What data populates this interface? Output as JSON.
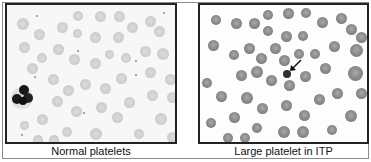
{
  "figure": {
    "panels": [
      {
        "id": "left",
        "caption": "Normal platelets",
        "description": "Blood smear with pale red cells, small scattered normal platelets and one neutrophil"
      },
      {
        "id": "right",
        "caption": "Large platelet in ITP",
        "description": "Blood smear with darker red cells and an arrow pointing to a large platelet"
      }
    ],
    "annotations": {
      "arrow": "arrow-pointing-to-large-platelet"
    },
    "colors": {
      "frame": "#8a8a8a",
      "panel_border": "#222222",
      "left_cell": "#cfcfcf",
      "right_cell": "#8d8d8d",
      "neutrophil": "#1a1a1a",
      "large_platelet": "#2e2e2e"
    }
  }
}
